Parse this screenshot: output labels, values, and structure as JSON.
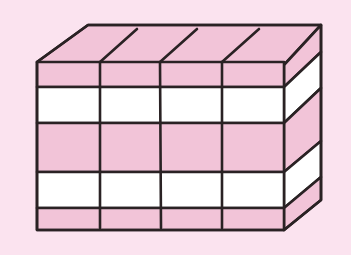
{
  "figure": {
    "columns": 4,
    "layers": [
      "pink",
      "white",
      "pink",
      "white",
      "pink"
    ],
    "colors": {
      "background": "#fbe3ef",
      "pink": "#f2c4d8",
      "white": "#ffffff",
      "outline": "#2a2224"
    }
  }
}
